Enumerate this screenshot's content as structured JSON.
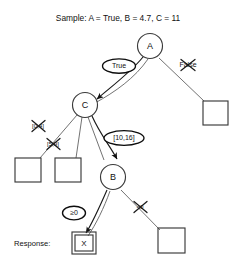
{
  "title": "Sample: A = True, B = 4.7, C = 11",
  "response": {
    "label": "Response:",
    "value": "X"
  },
  "nodes": {
    "a": "A",
    "b": "B",
    "c": "C"
  },
  "edges": {
    "a_true": "True",
    "a_false": "False",
    "c_branch1": "[0,4]",
    "c_branch2": "[5,9]",
    "c_branch3": "[10,16]",
    "b_ge0": "≥0",
    "b_lt0": "<0"
  },
  "colors": {
    "ink": "#111111",
    "line": "#6a6a6a",
    "active": "#0d0d0d",
    "background": "#ffffff"
  }
}
